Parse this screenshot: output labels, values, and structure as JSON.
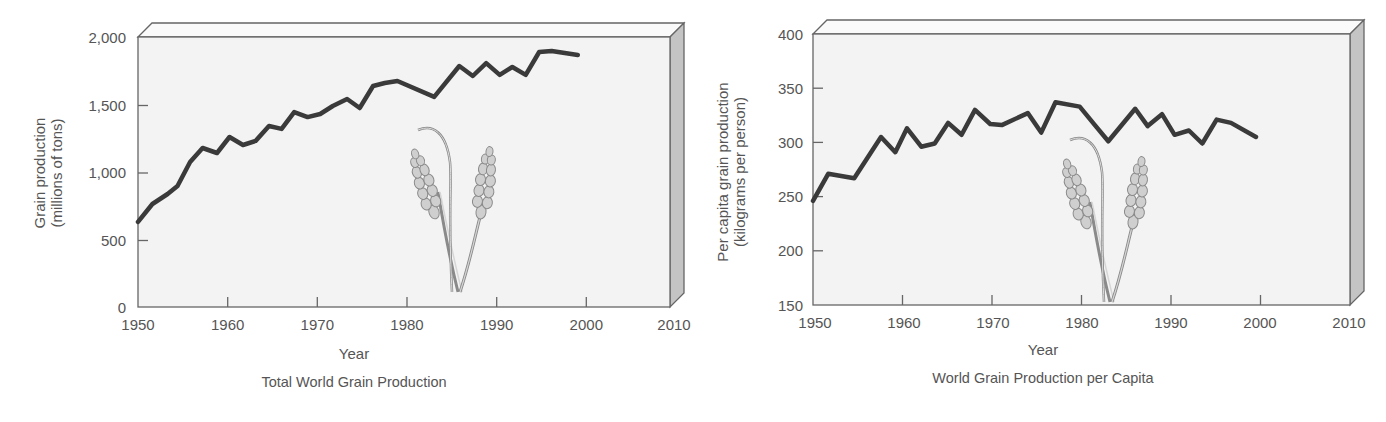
{
  "chart_data": [
    {
      "type": "line",
      "title": "Total World Grain Production",
      "xlabel": "Year",
      "ylabel": "Grain production",
      "ylabel_units": "(millions of tons)",
      "xlim": [
        1950,
        2010
      ],
      "ylim": [
        0,
        2000
      ],
      "x_ticks": [
        1950,
        1960,
        1970,
        1980,
        1990,
        2000,
        2010
      ],
      "x_tick_labels": [
        "1950",
        "1960",
        "1970",
        "1980",
        "1990",
        "2000",
        "2010"
      ],
      "y_ticks": [
        0,
        500,
        1000,
        1500,
        2000
      ],
      "y_tick_labels": [
        "0",
        "500",
        "1,000",
        "1,500",
        "2,000"
      ],
      "grid": false,
      "legend": null,
      "series": [
        {
          "name": "Total grain production",
          "color": "#3a3a3a",
          "x": [
            1950,
            1951.6,
            1953.3,
            1954.4,
            1955.8,
            1957.2,
            1958.8,
            1960.2,
            1961.7,
            1963.1,
            1964.6,
            1966,
            1967.4,
            1968.9,
            1970.3,
            1971.7,
            1973.3,
            1974.7,
            1976.2,
            1977.5,
            1978.9,
            1983,
            1985.8,
            1987.3,
            1988.8,
            1990.3,
            1991.7,
            1993.2,
            1994.7,
            1996.1,
            1999
          ],
          "values": [
            630,
            763,
            837,
            896,
            1074,
            1178,
            1141,
            1259,
            1200,
            1230,
            1341,
            1319,
            1444,
            1407,
            1430,
            1489,
            1541,
            1474,
            1637,
            1659,
            1674,
            1556,
            1785,
            1711,
            1807,
            1719,
            1778,
            1719,
            1889,
            1896,
            1867
          ]
        }
      ]
    },
    {
      "type": "line",
      "title": "World Grain Production per Capita",
      "xlabel": "Year",
      "ylabel": "Per capita grain production",
      "ylabel_units": "(kilograms per person)",
      "xlim": [
        1950,
        2010
      ],
      "ylim": [
        150,
        400
      ],
      "x_ticks": [
        1950,
        1960,
        1970,
        1980,
        1990,
        2000,
        2010
      ],
      "x_tick_labels": [
        "1950",
        "1960",
        "1970",
        "1980",
        "1990",
        "2000",
        "2010"
      ],
      "y_ticks": [
        150,
        200,
        250,
        300,
        350,
        400
      ],
      "y_tick_labels": [
        "150",
        "200",
        "250",
        "300",
        "350",
        "400"
      ],
      "grid": false,
      "legend": null,
      "series": [
        {
          "name": "Per capita grain production",
          "color": "#3a3a3a",
          "x": [
            1950,
            1951.7,
            1954.6,
            1957.6,
            1959.2,
            1960.5,
            1962.1,
            1963.6,
            1965.1,
            1966.6,
            1968.1,
            1969.8,
            1971.1,
            1974,
            1975.5,
            1977.1,
            1979.8,
            1981.5,
            1983,
            1986,
            1987.4,
            1989,
            1990.4,
            1992,
            1993.5,
            1995.1,
            1996.7,
            1999.5
          ],
          "values": [
            246,
            271,
            267,
            305,
            291,
            313,
            296,
            299,
            318,
            307,
            330,
            317,
            316,
            327,
            309,
            337,
            333,
            316,
            301,
            331,
            315,
            326,
            307,
            311,
            299,
            321,
            318,
            305
          ]
        }
      ]
    }
  ],
  "charts": [
    {
      "title": "Total World Grain Production",
      "xlabel": "Year",
      "ylabel_line1": "Grain production",
      "ylabel_line2": "(millions of tons)",
      "x_tick_labels": [
        "1950",
        "1960",
        "1970",
        "1980",
        "1990",
        "2000",
        "2010"
      ],
      "y_tick_labels": [
        "0",
        "500",
        "1,000",
        "1,500",
        "2,000"
      ],
      "illustration": "wheat-icon"
    },
    {
      "title": "World Grain Production per Capita",
      "xlabel": "Year",
      "ylabel_line1": "Per capita grain production",
      "ylabel_line2": "(kilograms per person)",
      "x_tick_labels": [
        "1950",
        "1960",
        "1970",
        "1980",
        "1990",
        "2000",
        "2010"
      ],
      "y_tick_labels": [
        "150",
        "200",
        "250",
        "300",
        "350",
        "400"
      ],
      "illustration": "wheat-icon"
    }
  ],
  "colors": {
    "line": "#3a3a3a",
    "axis": "#666666",
    "panel_bg": "#f3f3f3",
    "side_panel": "#c4c4c4",
    "text": "#555555",
    "wheat_fill": "#cfcfcf",
    "wheat_stroke": "#8a8a8a"
  }
}
